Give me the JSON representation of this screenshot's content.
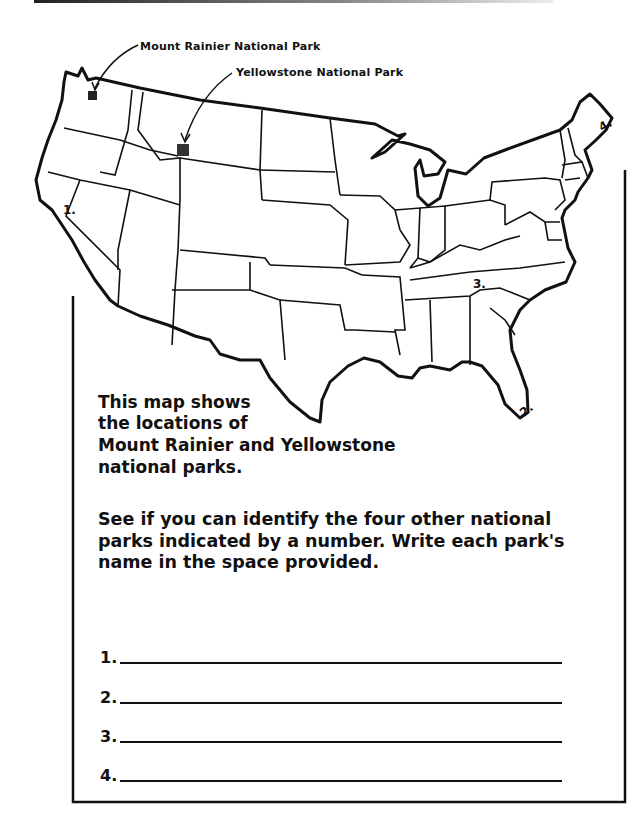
{
  "callouts": {
    "rainier": "Mount Rainier National Park",
    "yellowstone": "Yellowstone National Park"
  },
  "map_markers": [
    {
      "label": "1.",
      "region": "California"
    },
    {
      "label": "2.",
      "region": "Florida"
    },
    {
      "label": "3.",
      "region": "Tennessee / North Carolina"
    },
    {
      "label": "4.",
      "region": "Maine"
    }
  ],
  "intro": {
    "line1": "This map shows",
    "line2": "the locations of",
    "line3": "Mount Rainier and Yellowstone",
    "line4": "national parks."
  },
  "instructions": "See if you can identify the four other national parks indicated by a number. Write each park's name in the space provided.",
  "answers": [
    {
      "number": "1.",
      "value": ""
    },
    {
      "number": "2.",
      "value": ""
    },
    {
      "number": "3.",
      "value": ""
    },
    {
      "number": "4.",
      "value": ""
    }
  ]
}
